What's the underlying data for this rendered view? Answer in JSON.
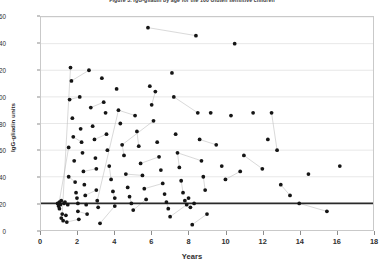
{
  "figure": {
    "title": "Figure 3.    IgG-gliadin by age for the 100 Gluten sensitive children"
  },
  "chart_data": {
    "type": "scatter",
    "title": "Figure 3.    IgG-gliadin by age for the 100 Gluten sensitive children",
    "xlabel": "Years",
    "ylabel": "IgG-gliadin units",
    "xlim": [
      0,
      18
    ],
    "ylim": [
      0,
      160
    ],
    "xticks": [
      0,
      2,
      4,
      6,
      8,
      10,
      12,
      14,
      16,
      18
    ],
    "yticks": [
      0,
      20,
      40,
      60,
      80,
      100,
      120,
      140,
      160
    ],
    "grid": "horizontal",
    "legend": "none",
    "marker": "filled-circle",
    "marker_color": "#151515",
    "connector_color": "#b8b8b8",
    "reference_line": {
      "axis": "y",
      "value": 20,
      "label": "cutoff",
      "color": "#2a2a2a",
      "width": 2
    },
    "points": [
      [
        0.9,
        20
      ],
      [
        0.95,
        18
      ],
      [
        1.0,
        21
      ],
      [
        1.0,
        16
      ],
      [
        1.05,
        19
      ],
      [
        1.1,
        22
      ],
      [
        1.1,
        9
      ],
      [
        1.15,
        12
      ],
      [
        1.2,
        7
      ],
      [
        1.25,
        20
      ],
      [
        1.3,
        21
      ],
      [
        1.35,
        11
      ],
      [
        1.4,
        6
      ],
      [
        1.45,
        19
      ],
      [
        1.5,
        40
      ],
      [
        1.5,
        62
      ],
      [
        1.55,
        98
      ],
      [
        1.6,
        122
      ],
      [
        1.65,
        112
      ],
      [
        1.7,
        84
      ],
      [
        1.75,
        70
      ],
      [
        1.8,
        52
      ],
      [
        1.85,
        36
      ],
      [
        1.9,
        28
      ],
      [
        1.95,
        24
      ],
      [
        2.0,
        20
      ],
      [
        2.0,
        14
      ],
      [
        2.05,
        8
      ],
      [
        2.1,
        100
      ],
      [
        2.15,
        76
      ],
      [
        2.2,
        66
      ],
      [
        2.25,
        58
      ],
      [
        2.3,
        44
      ],
      [
        2.35,
        34
      ],
      [
        2.4,
        26
      ],
      [
        2.45,
        19
      ],
      [
        2.5,
        12
      ],
      [
        2.6,
        120
      ],
      [
        2.7,
        92
      ],
      [
        2.8,
        78
      ],
      [
        2.9,
        68
      ],
      [
        2.95,
        54
      ],
      [
        3.0,
        46
      ],
      [
        3.0,
        30
      ],
      [
        3.05,
        22
      ],
      [
        3.1,
        17
      ],
      [
        3.2,
        5
      ],
      [
        3.3,
        114
      ],
      [
        3.4,
        96
      ],
      [
        3.5,
        88
      ],
      [
        3.55,
        72
      ],
      [
        3.6,
        60
      ],
      [
        3.7,
        48
      ],
      [
        3.8,
        38
      ],
      [
        3.9,
        29
      ],
      [
        4.0,
        24
      ],
      [
        4.0,
        18
      ],
      [
        4.1,
        106
      ],
      [
        4.2,
        90
      ],
      [
        4.3,
        80
      ],
      [
        4.4,
        64
      ],
      [
        4.5,
        56
      ],
      [
        4.6,
        42
      ],
      [
        4.7,
        32
      ],
      [
        4.8,
        25
      ],
      [
        4.9,
        20
      ],
      [
        5.0,
        15
      ],
      [
        5.1,
        86
      ],
      [
        5.2,
        74
      ],
      [
        5.3,
        63
      ],
      [
        5.4,
        50
      ],
      [
        5.5,
        41
      ],
      [
        5.6,
        31
      ],
      [
        5.7,
        23
      ],
      [
        5.8,
        152
      ],
      [
        5.9,
        108
      ],
      [
        6.0,
        94
      ],
      [
        6.1,
        82
      ],
      [
        6.2,
        104
      ],
      [
        6.3,
        66
      ],
      [
        6.4,
        55
      ],
      [
        6.5,
        45
      ],
      [
        6.6,
        35
      ],
      [
        6.7,
        27
      ],
      [
        6.8,
        21
      ],
      [
        6.9,
        16
      ],
      [
        7.0,
        10
      ],
      [
        7.1,
        118
      ],
      [
        7.2,
        100
      ],
      [
        7.3,
        72
      ],
      [
        7.4,
        58
      ],
      [
        7.5,
        47
      ],
      [
        7.6,
        37
      ],
      [
        7.7,
        28
      ],
      [
        7.8,
        22
      ],
      [
        7.9,
        19
      ],
      [
        8.0,
        24
      ],
      [
        8.1,
        17
      ],
      [
        8.2,
        4
      ],
      [
        8.3,
        20
      ],
      [
        8.4,
        146
      ],
      [
        8.5,
        88
      ],
      [
        8.6,
        68
      ],
      [
        8.7,
        52
      ],
      [
        8.8,
        40
      ],
      [
        8.9,
        30
      ],
      [
        9.0,
        12
      ],
      [
        9.2,
        88
      ],
      [
        9.5,
        64
      ],
      [
        9.8,
        48
      ],
      [
        10.0,
        38
      ],
      [
        10.3,
        86
      ],
      [
        10.5,
        140
      ],
      [
        10.8,
        44
      ],
      [
        11.0,
        56
      ],
      [
        11.5,
        88
      ],
      [
        12.0,
        46
      ],
      [
        12.3,
        68
      ],
      [
        12.5,
        88
      ],
      [
        12.8,
        60
      ],
      [
        13.0,
        34
      ],
      [
        13.5,
        26
      ],
      [
        14.0,
        20
      ],
      [
        14.5,
        42
      ],
      [
        15.5,
        14
      ],
      [
        16.2,
        48
      ]
    ],
    "connected_series_note": "Subsets of points are joined by thin gray lines representing repeated measurements on the same child."
  }
}
